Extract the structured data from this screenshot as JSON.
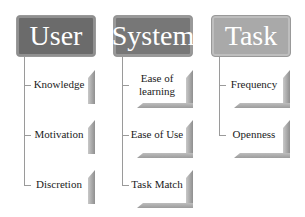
{
  "diagram": {
    "columns": [
      {
        "title": "User",
        "color": "#6b6b6b",
        "items": [
          "Knowledge",
          "Motivation",
          "Discretion"
        ]
      },
      {
        "title": "System",
        "color": "#777777",
        "items": [
          "Ease of learning",
          "Ease of Use",
          "Task Match"
        ]
      },
      {
        "title": "Task",
        "color": "#a9a9a9",
        "items": [
          "Frequency",
          "Openness"
        ]
      }
    ]
  }
}
